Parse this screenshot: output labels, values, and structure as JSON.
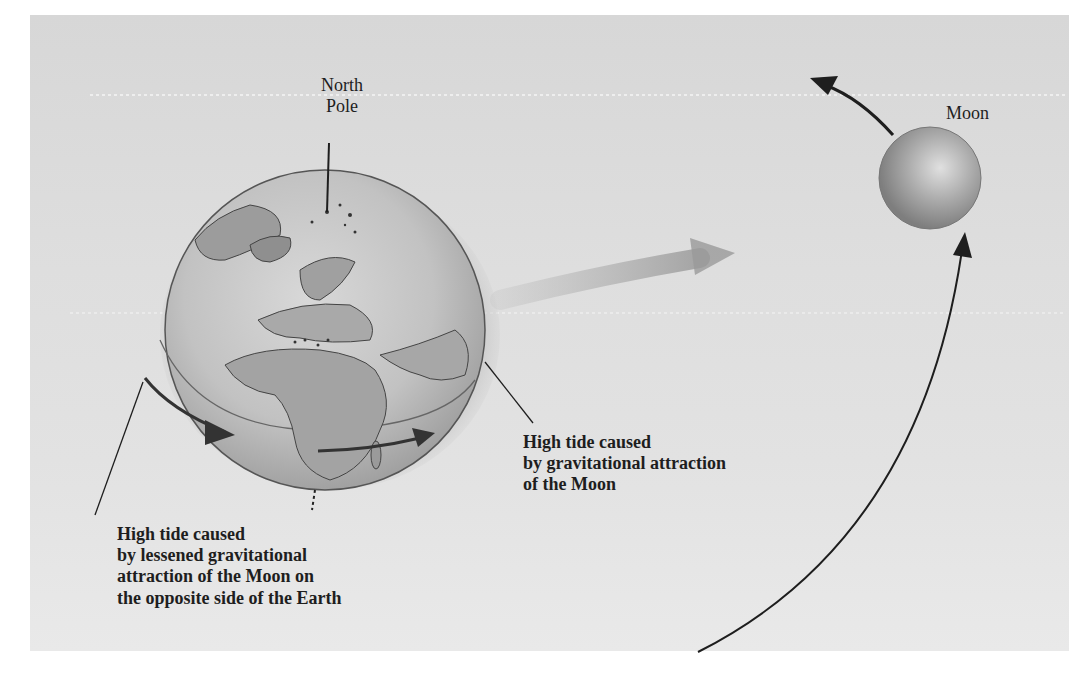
{
  "diagram": {
    "labels": {
      "north_pole": [
        "North",
        "Pole"
      ],
      "moon": "Moon",
      "high_tide_near": [
        "High tide caused",
        "by gravitational attraction",
        "of the Moon"
      ],
      "high_tide_far": [
        "High tide caused",
        "by lessened gravitational",
        "attraction of the Moon on",
        "the opposite side of the Earth"
      ]
    },
    "elements": [
      {
        "id": "earth",
        "type": "globe",
        "description": "Earth viewed showing Europe, Africa, North Pole region, with tidal bulge envelope"
      },
      {
        "id": "moon",
        "type": "sphere",
        "description": "Moon"
      },
      {
        "id": "earth-rotation-arrows",
        "type": "arrows",
        "count": 2,
        "direction": "eastward rotation"
      },
      {
        "id": "gravity-arrow",
        "type": "arrow",
        "description": "Faint arrow from Earth toward Moon indicating gravitational pull"
      },
      {
        "id": "moon-orbit-arrow",
        "type": "arc-arrow",
        "description": "Moon's orbital path"
      }
    ],
    "colors": {
      "background_panel": "#dcdcdc",
      "ink": "#1e1e1e",
      "earth_land": "#9a9a9a",
      "earth_ocean": "#c4c4c4",
      "tide_bulge": "#a8a8a8",
      "moon": "#9c9c9c"
    }
  }
}
